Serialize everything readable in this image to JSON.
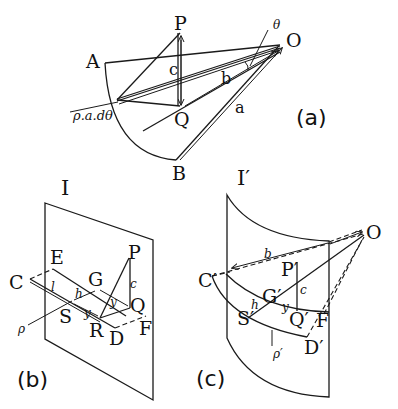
{
  "figure": {
    "panel_a": {
      "caption": "(a)",
      "points": {
        "P": "P",
        "O": "O",
        "A": "A",
        "B": "B",
        "Q": "Q"
      },
      "labels": {
        "theta": "θ",
        "c": "c",
        "b": "b",
        "a": "a",
        "arc": "ρ.a.dθ"
      }
    },
    "panel_b": {
      "caption": "(b)",
      "plane": "I",
      "points": {
        "C": "C",
        "E": "E",
        "G": "G",
        "P": "P",
        "Q": "Q",
        "S": "S",
        "R": "R",
        "D": "D",
        "F": "F"
      },
      "labels": {
        "l": "l",
        "h": "h",
        "y1": "y",
        "y2": "y",
        "c": "c",
        "rho": "ρ"
      }
    },
    "panel_c": {
      "caption": "(c)",
      "plane": "I′",
      "points": {
        "O": "O",
        "C": "C′",
        "P": "P′",
        "G": "G′",
        "S": "S′",
        "Q": "Q′",
        "F": "F",
        "D": "D′"
      },
      "labels": {
        "b": "b",
        "c": "c",
        "h": "h",
        "y": "y",
        "rho": "ρ′"
      }
    }
  }
}
